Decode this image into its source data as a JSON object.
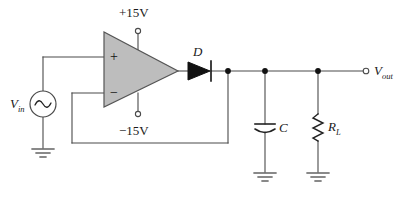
{
  "figure": {
    "kind": "circuit-schematic",
    "title_visible": false,
    "background_color": "#ffffff",
    "wire_color": "#4a4a4a",
    "opamp_fill": "#bdbdbd",
    "opamp_stroke": "#555555",
    "text_color": "#1a1a1a"
  },
  "labels": {
    "supply_positive": "+15V",
    "supply_negative": "−15V",
    "input_source_main": "V",
    "input_source_sub": "in",
    "output_main": "V",
    "output_sub": "out",
    "diode": "D",
    "capacitor": "C",
    "resistor_main": "R",
    "resistor_sub": "L",
    "opamp_noninverting": "+",
    "opamp_inverting": "−"
  },
  "components": {
    "opamp": {
      "name": "operational-amplifier",
      "noninverting_input_y": 57,
      "inverting_input_y": 93,
      "output_x": 178,
      "output_y": 71
    },
    "source": {
      "name": "ac-voltage-source",
      "symbol": "sine-wave",
      "center_x": 43,
      "center_y": 104,
      "radius": 13
    },
    "diode": {
      "name": "rectifier-diode",
      "anode_x": 187,
      "cathode_x": 211,
      "y": 71
    },
    "capacitor": {
      "name": "filter-capacitor",
      "x": 265,
      "y": 127,
      "style": "polarized"
    },
    "resistor": {
      "name": "load-resistor",
      "x": 318,
      "y": 127,
      "style": "zigzag"
    },
    "output_terminal": {
      "name": "output-terminal",
      "x": 366,
      "y": 71
    },
    "grounds": [
      {
        "name": "ground-source",
        "x": 43,
        "y": 148
      },
      {
        "name": "ground-capacitor",
        "x": 265,
        "y": 172
      },
      {
        "name": "ground-resistor",
        "x": 318,
        "y": 172
      }
    ],
    "nodes": [
      {
        "name": "node-diode-output",
        "x": 228,
        "y": 71
      },
      {
        "name": "node-capacitor",
        "x": 265,
        "y": 71
      },
      {
        "name": "node-resistor",
        "x": 318,
        "y": 71
      }
    ]
  }
}
